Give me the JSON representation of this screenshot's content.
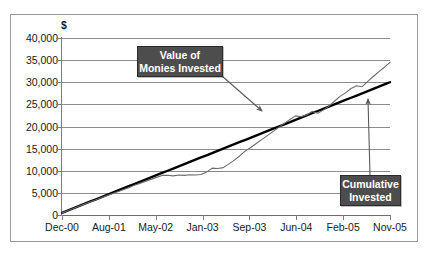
{
  "top_title": "",
  "chart_data": {
    "type": "line",
    "title": "",
    "xlabel": "",
    "ylabel": "$",
    "unit_label": "$",
    "ylim": [
      0,
      40000
    ],
    "yticks": [
      0,
      5000,
      10000,
      15000,
      20000,
      25000,
      30000,
      35000,
      40000
    ],
    "ytick_labels": [
      "0",
      "5,000",
      "10,000",
      "15,000",
      "20,000",
      "25,000",
      "30,000",
      "35,000",
      "40,000"
    ],
    "grid": true,
    "legend": "none",
    "xtick_labels": [
      "Dec-00",
      "Aug-01",
      "May-02",
      "Jan-03",
      "Sep-03",
      "Jun-04",
      "Feb-05",
      "Nov-05"
    ],
    "x_start": "Dec-00",
    "x_end": "Nov-05",
    "x_months": 60,
    "series": [
      {
        "name": "Cumulative Invested",
        "color": "#000000",
        "style": "thick-straight",
        "start_value": 500,
        "end_value": 30000,
        "values": [
          500,
          1000,
          1500,
          2000,
          2500,
          3000,
          3500,
          4000,
          4500,
          5000,
          5500,
          6000,
          6500,
          7000,
          7500,
          8000,
          8500,
          9000,
          9500,
          10000,
          10500,
          11000,
          11500,
          12000,
          12500,
          13000,
          13500,
          14000,
          14500,
          15000,
          15500,
          16000,
          16500,
          17000,
          17500,
          18000,
          18500,
          19000,
          19500,
          20000,
          20500,
          21000,
          21500,
          22000,
          22500,
          23000,
          23500,
          24000,
          24500,
          25000,
          25500,
          26000,
          26500,
          27000,
          27500,
          28000,
          28500,
          29000,
          29500,
          30000
        ]
      },
      {
        "name": "Value of Monies Invested",
        "color": "#6b6b6b",
        "style": "thin-volatile",
        "start_value": 480,
        "end_value": 34500,
        "values": [
          480,
          980,
          1450,
          1980,
          2420,
          2950,
          3380,
          3900,
          4350,
          4820,
          5250,
          5700,
          6150,
          6700,
          7150,
          7600,
          8050,
          8500,
          8950,
          9000,
          8850,
          9050,
          8950,
          9100,
          9050,
          9150,
          9700,
          10600,
          10500,
          10700,
          11500,
          12400,
          13400,
          14500,
          15300,
          16200,
          17100,
          18000,
          18900,
          19800,
          20700,
          21600,
          22400,
          22200,
          22600,
          23400,
          23000,
          23700,
          24600,
          25700,
          26800,
          27600,
          28600,
          29200,
          29000,
          30200,
          31300,
          32400,
          33400,
          34500
        ]
      }
    ],
    "annotations": [
      {
        "name": "value-of-monies-invested",
        "line1": "Value of",
        "line2": "Monies Invested",
        "points_to_series": "Value of Monies Invested",
        "arrow_from": [
          222,
          76
        ],
        "arrow_to": [
          262,
          111
        ]
      },
      {
        "name": "cumulative-invested",
        "line1": "Cumulative",
        "line2": "Invested",
        "points_to_series": "Cumulative Invested",
        "arrow_from": [
          370,
          175
        ],
        "arrow_to": [
          368,
          99
        ]
      }
    ]
  },
  "colors": {
    "cumulative_line": "#000000",
    "value_line": "#6b6b6b",
    "callout_bg": "#4d4d4d",
    "callout_text": "#ffffff",
    "gridline": "#8c8c8c",
    "axis": "#7d7d7d",
    "frame": "#9a9a9a",
    "background": "#ffffff"
  }
}
